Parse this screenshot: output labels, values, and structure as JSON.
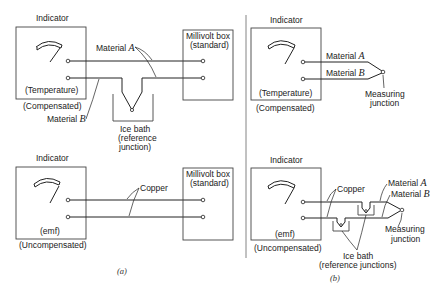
{
  "panel_a": {
    "caption": "(a)",
    "top": {
      "indicator_title": "Indicator",
      "indicator_line1": "(Temperature)",
      "indicator_line2": "(Compensated)",
      "millivolt_line1": "Millivolt box",
      "millivolt_line2": "(standard)",
      "material_a_label": "Material",
      "material_a_letter": "A",
      "material_b_label": "Material",
      "material_b_letter": "B",
      "ice_bath_line1": "Ice bath",
      "ice_bath_line2": "(reference",
      "ice_bath_line3": "junction)"
    },
    "bottom": {
      "indicator_title": "Indicator",
      "indicator_line1": "(emf)",
      "indicator_line2": "(Uncompensated)",
      "millivolt_line1": "Millivolt box",
      "millivolt_line2": "(standard)",
      "copper_label": "Copper"
    }
  },
  "panel_b": {
    "caption": "(b)",
    "top": {
      "indicator_title": "Indicator",
      "indicator_line1": "(Temperature)",
      "indicator_line2": "(Compensated)",
      "material_a_label": "Material",
      "material_a_letter": "A",
      "material_b_label": "Material",
      "material_b_letter": "B",
      "junction_line1": "Measuring",
      "junction_line2": "junction"
    },
    "bottom": {
      "indicator_title": "Indicator",
      "indicator_line1": "(emf)",
      "indicator_line2": "(Uncompensated)",
      "copper_label": "Copper",
      "material_a_label": "Material",
      "material_a_letter": "A",
      "material_b_label": "Material",
      "material_b_letter": "B",
      "junction_line1": "Measuring",
      "junction_line2": "junction",
      "ice_bath_line1": "Ice bath",
      "ice_bath_line2": "(reference junctions)"
    }
  }
}
